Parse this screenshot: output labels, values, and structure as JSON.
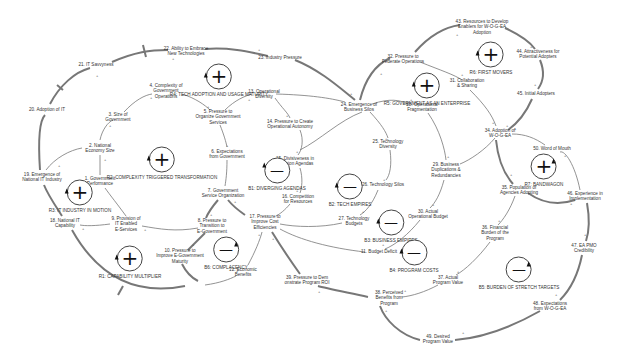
{
  "diagram": {
    "type": "causal-loop-diagram",
    "variables": [
      {
        "id": "v1",
        "label": "1. Government\nPerformance",
        "x": 100,
        "y": 181
      },
      {
        "id": "v2",
        "label": "2. National\nEconomy Size",
        "x": 100,
        "y": 148
      },
      {
        "id": "v3",
        "label": "3. Size of\nGovernment",
        "x": 118,
        "y": 117
      },
      {
        "id": "v4",
        "label": "4. Complexity of\nGovernment\nOperations",
        "x": 166,
        "y": 91
      },
      {
        "id": "v5",
        "label": "5. Pressure to\nOrganize Government\nServices",
        "x": 218,
        "y": 117
      },
      {
        "id": "v6",
        "label": "6. Expectations\nfrom Government",
        "x": 227,
        "y": 154
      },
      {
        "id": "v7",
        "label": "7. Government\nService Organization",
        "x": 223,
        "y": 193
      },
      {
        "id": "v8",
        "label": "8. Pressure to\nTransition to\nE-Government",
        "x": 212,
        "y": 226
      },
      {
        "id": "v9",
        "label": "9. Provision of\nIT Enabled\nE-Services",
        "x": 126,
        "y": 224
      },
      {
        "id": "v10",
        "label": "10. Pressure to\nImprove E-Government\nMaturity",
        "x": 180,
        "y": 256
      },
      {
        "id": "v11",
        "label": "11. Budget Deficit",
        "x": 379,
        "y": 252
      },
      {
        "id": "v12",
        "label": "12. Economic\nBenefits",
        "x": 243,
        "y": 272
      },
      {
        "id": "v13",
        "label": "13. Operational\nDiversity",
        "x": 264,
        "y": 94
      },
      {
        "id": "v14",
        "label": "14. Pressure to Create\nOperational Autonomy",
        "x": 290,
        "y": 124
      },
      {
        "id": "v15",
        "label": "15. Divisiveness in\nDecision Agendas",
        "x": 295,
        "y": 161
      },
      {
        "id": "v16",
        "label": "16. Competition\nfor Resources",
        "x": 298,
        "y": 199
      },
      {
        "id": "v17",
        "label": "17. Pressure to\nImprove Cost\nEfficiencies",
        "x": 265,
        "y": 222
      },
      {
        "id": "v19",
        "label": "19. Emergence of\nNational IT Industry",
        "x": 42,
        "y": 177
      },
      {
        "id": "v18",
        "label": "18. National IT\nCapability",
        "x": 65,
        "y": 223
      },
      {
        "id": "v20",
        "label": "20. Adoption of IT",
        "x": 47,
        "y": 110
      },
      {
        "id": "v21",
        "label": "21. IT Savvyness",
        "x": 96,
        "y": 65
      },
      {
        "id": "v22",
        "label": "22. Ability to Embrace\nNew Technologies",
        "x": 186,
        "y": 51
      },
      {
        "id": "v23",
        "label": "23. Industry Pressure",
        "x": 280,
        "y": 58
      },
      {
        "id": "v24",
        "label": "24. Emergence of\nBusiness Silos",
        "x": 359,
        "y": 107
      },
      {
        "id": "v25",
        "label": "25. Technology\nDiversity",
        "x": 388,
        "y": 144
      },
      {
        "id": "v26",
        "label": "26. Technology Silos",
        "x": 383,
        "y": 185
      },
      {
        "id": "v27",
        "label": "27. Technology\nBudgets",
        "x": 354,
        "y": 221
      },
      {
        "id": "v28",
        "label": "28. Operational\nFragmentation",
        "x": 422,
        "y": 107
      },
      {
        "id": "v29",
        "label": "29. Business\nDuplications &\nRedundancies",
        "x": 446,
        "y": 170
      },
      {
        "id": "v30",
        "label": "30. Actual\nOperational Budget",
        "x": 428,
        "y": 214
      },
      {
        "id": "v31",
        "label": "31. Collaboration\n& Sharing",
        "x": 467,
        "y": 83
      },
      {
        "id": "v32",
        "label": "32. Pressure to\nFederate Operations",
        "x": 403,
        "y": 59
      },
      {
        "id": "v34",
        "label": "34. Adoption of\nW-O-G-EA",
        "x": 500,
        "y": 133
      },
      {
        "id": "v35",
        "label": "35. Population of\nAgencies Adopting",
        "x": 519,
        "y": 190
      },
      {
        "id": "v36",
        "label": "36. Financial\nBurden of the\nProgram",
        "x": 495,
        "y": 233
      },
      {
        "id": "v37",
        "label": "37. Actual\nProgram Value",
        "x": 448,
        "y": 280
      },
      {
        "id": "v38",
        "label": "38. Perceived\nBenefits from\nProgram",
        "x": 389,
        "y": 298
      },
      {
        "id": "v39",
        "label": "39. Pressure to Dem\nonstrate Program ROI",
        "x": 307,
        "y": 280
      },
      {
        "id": "v43",
        "label": "43. Resources to Develop\nEnablers for W-O-G-EA\nAdoption",
        "x": 482,
        "y": 27
      },
      {
        "id": "v44",
        "label": "44. Attractiveness for\nPotential Adopters",
        "x": 538,
        "y": 54
      },
      {
        "id": "v45",
        "label": "45. Initial Adopters",
        "x": 536,
        "y": 94
      },
      {
        "id": "v46",
        "label": "46. Experience in\nImplementation",
        "x": 585,
        "y": 196
      },
      {
        "id": "v47",
        "label": "47. EA PMO\nCredibility",
        "x": 584,
        "y": 248
      },
      {
        "id": "v48",
        "label": "48. Expectations\nfrom W-O-G-EA",
        "x": 550,
        "y": 306
      },
      {
        "id": "v49",
        "label": "49. Desired\nProgram Value",
        "x": 438,
        "y": 339
      },
      {
        "id": "v50",
        "label": "50. Word of Mouth",
        "x": 552,
        "y": 149
      }
    ],
    "loops": [
      {
        "id": "R4",
        "label": "R4: TECH ADOPTION AND USAGE MATURITY",
        "type": "reinforcing",
        "symbol": "+",
        "x": 219,
        "y": 74
      },
      {
        "id": "R2",
        "label": "R2: COMPLEXITY TRIGGERED TRANSFORMATION",
        "type": "reinforcing",
        "symbol": "+",
        "x": 162,
        "y": 163
      },
      {
        "id": "R3",
        "label": "R3: IT INDUSTRY IN MOTION",
        "type": "reinforcing",
        "symbol": "+",
        "x": 80,
        "y": 193
      },
      {
        "id": "R1",
        "label": "R1: CAPABILITY MULTIPLIER",
        "type": "reinforcing",
        "symbol": "+",
        "x": 130,
        "y": 262
      },
      {
        "id": "B6",
        "label": "B6: COMPLACENCY",
        "type": "balancing",
        "symbol": "—",
        "x": 226,
        "y": 253
      },
      {
        "id": "B1",
        "label": "B1: DIVERGING AGENDAS",
        "type": "balancing",
        "symbol": "—",
        "x": 277,
        "y": 172
      },
      {
        "id": "B2",
        "label": "B2: TECH EMPIRES",
        "type": "balancing",
        "symbol": "—",
        "x": 350,
        "y": 190
      },
      {
        "id": "B3",
        "label": "B3: BUSINESS EMPIRES",
        "type": "balancing",
        "symbol": "—",
        "x": 391,
        "y": 226
      },
      {
        "id": "B4",
        "label": "B4: PROGRAM COSTS",
        "type": "balancing",
        "symbol": "—",
        "x": 414,
        "y": 254
      },
      {
        "id": "B5",
        "label": "B5: BURDEN OF STRETCH TARGETS",
        "type": "balancing",
        "symbol": "—",
        "x": 519,
        "y": 273
      },
      {
        "id": "R5",
        "label": "R5: GOVERNMENT AS AN ENTERPRISE",
        "type": "reinforcing",
        "symbol": "+",
        "x": 427,
        "y": 89
      },
      {
        "id": "R6",
        "label": "R6: FIRST MOVERS",
        "type": "reinforcing",
        "symbol": "+",
        "x": 491,
        "y": 58
      },
      {
        "id": "R7",
        "label": "R7: BANDWAGON",
        "type": "reinforcing",
        "symbol": "+",
        "x": 544,
        "y": 170
      }
    ],
    "link_polarity_symbol": "+",
    "colors": {
      "links": "#777777",
      "text": "#333333",
      "loop_icon": "#111111",
      "background": "#ffffff"
    }
  }
}
